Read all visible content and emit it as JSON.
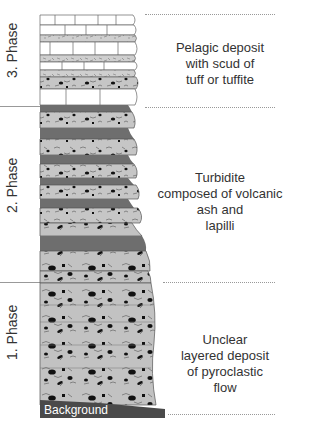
{
  "diagram": {
    "type": "stratigraphic-column",
    "phases": [
      {
        "label": "3. Phase",
        "description": "Pelagic deposit\nwith scud of\ntuff or tuffite"
      },
      {
        "label": "2. Phase",
        "description": "Turbidite\ncomposed of volcanic\nash and\nlapilli"
      },
      {
        "label": "1. Phase",
        "description": "Unclear\nlayered deposit\nof pyroclastic\nflow"
      }
    ],
    "base_label": "Background",
    "colors": {
      "limestone_fill": "#ffffff",
      "tuff_fill": "#c9c9c9",
      "ash_fill": "#c4c4c4",
      "mud_band": "#6e6e6e",
      "background_band": "#4a4a4a",
      "outline": "#555555",
      "clast": "#111111",
      "text": "#333333"
    }
  }
}
